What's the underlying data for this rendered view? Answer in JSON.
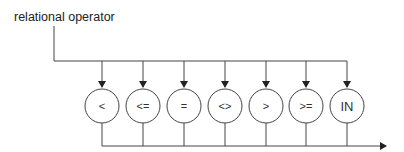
{
  "diagram": {
    "title": "relational operator",
    "operators": [
      {
        "label": "<",
        "x": 102
      },
      {
        "label": "<=",
        "x": 143
      },
      {
        "label": "=",
        "x": 184
      },
      {
        "label": "<>",
        "x": 225
      },
      {
        "label": ">",
        "x": 266
      },
      {
        "label": ">=",
        "x": 306
      },
      {
        "label": "IN",
        "x": 347
      }
    ],
    "line_color": "#444444"
  }
}
